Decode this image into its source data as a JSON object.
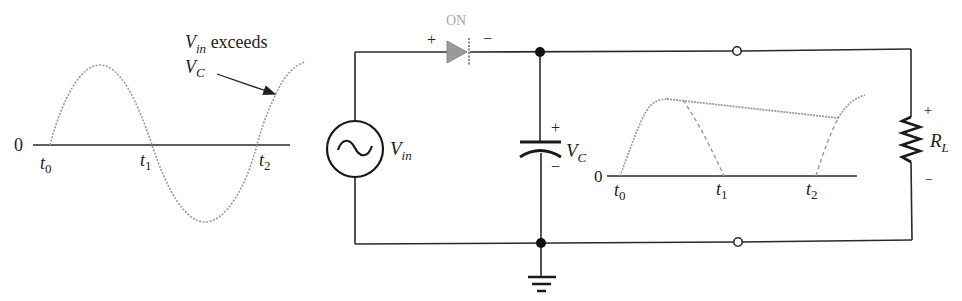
{
  "input_waveform": {
    "origin_label": "0",
    "time_labels": [
      {
        "base": "t",
        "sub": "0"
      },
      {
        "base": "t",
        "sub": "1"
      },
      {
        "base": "t",
        "sub": "2"
      }
    ],
    "annotation": {
      "line1_base": "V",
      "line1_sub": "in",
      "line1_text": " exceeds",
      "line2_base": "V",
      "line2_sub": "C"
    }
  },
  "circuit": {
    "source": {
      "base": "V",
      "sub": "in"
    },
    "diode": {
      "state_label": "ON",
      "plus": "+",
      "minus": "−"
    },
    "capacitor": {
      "base": "V",
      "sub": "C",
      "plus": "+",
      "minus": "−"
    },
    "load": {
      "base": "R",
      "sub": "L",
      "plus": "+",
      "minus": "−"
    }
  },
  "output_waveform": {
    "origin_label": "0",
    "time_labels": [
      {
        "base": "t",
        "sub": "0"
      },
      {
        "base": "t",
        "sub": "1"
      },
      {
        "base": "t",
        "sub": "2"
      }
    ]
  },
  "colors": {
    "wire": "#2a2a2a",
    "waveform": "#9a9a9a",
    "diode": "#8a8a8a"
  }
}
